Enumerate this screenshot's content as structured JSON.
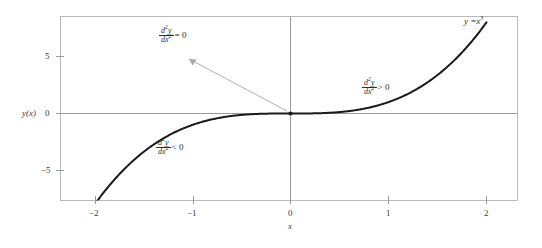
{
  "chart_data": {
    "type": "line",
    "title": "",
    "xlabel": "x",
    "ylabel": "y(x)",
    "xlim": [
      -2.35,
      2.33
    ],
    "ylim": [
      -8.1,
      8.1
    ],
    "grid": false,
    "legend": "none",
    "function": "y = x^3",
    "x_ticks": [
      -2,
      -1,
      0,
      1,
      2
    ],
    "x_tick_labels": [
      "−2",
      "−1",
      "0",
      "1",
      "2"
    ],
    "y_ticks": [
      5,
      0,
      -5
    ],
    "y_tick_labels": [
      "5",
      "0",
      "−5"
    ],
    "series": [
      {
        "name": "y = x^3",
        "x": [
          -2.0,
          -1.9,
          -1.8,
          -1.7,
          -1.6,
          -1.5,
          -1.4,
          -1.3,
          -1.2,
          -1.1,
          -1.0,
          -0.9,
          -0.8,
          -0.7,
          -0.6,
          -0.5,
          -0.4,
          -0.3,
          -0.2,
          -0.1,
          0.0,
          0.1,
          0.2,
          0.3,
          0.4,
          0.5,
          0.6,
          0.7,
          0.8,
          0.9,
          1.0,
          1.1,
          1.2,
          1.3,
          1.4,
          1.5,
          1.6,
          1.7,
          1.8,
          1.9,
          2.0
        ],
        "y": [
          -8.0,
          -6.859,
          -5.832,
          -4.913,
          -4.096,
          -3.375,
          -2.744,
          -2.197,
          -1.728,
          -1.331,
          -1.0,
          -0.729,
          -0.512,
          -0.343,
          -0.216,
          -0.125,
          -0.064,
          -0.027,
          -0.008,
          -0.001,
          0.0,
          0.001,
          0.008,
          0.027,
          0.064,
          0.125,
          0.216,
          0.343,
          0.512,
          0.729,
          1.0,
          1.331,
          1.728,
          2.197,
          2.744,
          3.375,
          4.096,
          4.913,
          5.832,
          6.859,
          8.0
        ]
      }
    ],
    "markers": [
      {
        "name": "inflection-point",
        "x": 0,
        "y": 0
      }
    ],
    "annotations": [
      {
        "name": "second-derivative-zero",
        "numerator": "d",
        "numerator_exp": "2",
        "numerator_var": "y",
        "denominator": "dx",
        "denominator_exp": "2",
        "relation": "= 0",
        "points_to": {
          "x": 0,
          "y": 0
        }
      },
      {
        "name": "second-derivative-positive",
        "numerator": "d",
        "numerator_exp": "2",
        "numerator_var": "y",
        "denominator": "dx",
        "denominator_exp": "2",
        "relation": "> 0"
      },
      {
        "name": "second-derivative-negative",
        "numerator": "d",
        "numerator_exp": "2",
        "numerator_var": "y",
        "denominator": "dx",
        "denominator_exp": "2",
        "relation": "< 0"
      }
    ],
    "curve_label": {
      "lhs": "y =",
      "base": "x",
      "exponent": "3"
    }
  },
  "axes": {
    "y_axis_label": "y(x)",
    "x_axis_label": "x",
    "y_tick_5": "5",
    "y_tick_0": "0",
    "y_tick_neg5": "−5",
    "x_tick_neg2": "−2",
    "x_tick_neg1": "−1",
    "x_tick_0": "0",
    "x_tick_1": "1",
    "x_tick_2": "2"
  },
  "labels": {
    "d2y": "d",
    "d2y_exp": "2",
    "d2y_var": "y",
    "dx2": "dx",
    "dx2_exp": "2",
    "eq_zero": "= 0",
    "gt_zero": "> 0",
    "lt_zero": "< 0",
    "curve_lhs": "y =",
    "curve_base": "x",
    "curve_exp": "3"
  },
  "colors": {
    "curve": "#1a1a1a",
    "frame": "#b9b9b9",
    "axis": "#9a9a9a",
    "text": "#2e2e2e",
    "arrow": "#a8a8a8",
    "background": "#ffffff"
  }
}
